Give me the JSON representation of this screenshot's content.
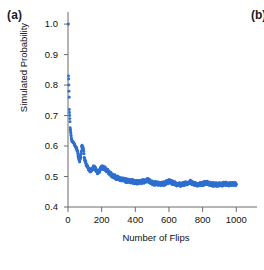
{
  "figure": {
    "panel_label": "(a)",
    "next_panel_label": "(b)",
    "background_color": "#ffffff",
    "series_color": "#2f6fd0",
    "axis_color": "#6b6b6b",
    "text_color": "#111111"
  },
  "chart_data": {
    "type": "scatter",
    "title": "",
    "subtitle": "",
    "xlabel": "Number of Flips",
    "ylabel": "Simulated Probability",
    "xlim": [
      0,
      1040
    ],
    "ylim": [
      0.4,
      1.02
    ],
    "xticks": [
      0,
      200,
      400,
      600,
      800,
      1000
    ],
    "xticklabels": [
      "0",
      "200",
      "400",
      "600",
      "800",
      "1000"
    ],
    "yticks": [
      0.4,
      0.5,
      0.6,
      0.7,
      0.8,
      0.9,
      1.0
    ],
    "yticklabels": [
      "0.4",
      "0.5",
      "0.6",
      "0.7",
      "0.8",
      "0.9",
      "1.0"
    ],
    "grid": false,
    "legend": false,
    "legend_position": "none",
    "marker": "point",
    "marker_size": 2,
    "annotations": [],
    "series": [
      {
        "name": "Simulated Probability",
        "color": "#2f6fd0",
        "x": [
          1,
          2,
          3,
          4,
          5,
          6,
          7,
          8,
          9,
          10,
          11,
          12,
          13,
          14,
          15,
          16,
          17,
          18,
          19,
          20,
          22,
          24,
          26,
          28,
          30,
          32,
          34,
          36,
          38,
          40,
          42,
          44,
          46,
          48,
          50,
          54,
          58,
          62,
          66,
          70,
          74,
          78,
          82,
          86,
          90,
          94,
          98,
          105,
          112,
          120,
          128,
          136,
          144,
          152,
          160,
          170,
          180,
          190,
          200,
          215,
          230,
          245,
          260,
          275,
          290,
          305,
          320,
          335,
          350,
          370,
          390,
          410,
          430,
          450,
          470,
          490,
          510,
          530,
          550,
          575,
          600,
          625,
          650,
          675,
          700,
          725,
          750,
          775,
          800,
          825,
          850,
          875,
          900,
          925,
          950,
          975,
          1000
        ],
        "y": [
          1.0,
          1.0,
          0.83,
          0.82,
          0.8,
          0.78,
          0.76,
          0.72,
          0.71,
          0.7,
          0.69,
          0.68,
          0.66,
          0.655,
          0.65,
          0.645,
          0.64,
          0.635,
          0.63,
          0.625,
          0.62,
          0.617,
          0.615,
          0.613,
          0.612,
          0.611,
          0.61,
          0.608,
          0.605,
          0.603,
          0.6,
          0.598,
          0.596,
          0.594,
          0.592,
          0.585,
          0.575,
          0.565,
          0.558,
          0.552,
          0.56,
          0.575,
          0.6,
          0.598,
          0.59,
          0.575,
          0.56,
          0.545,
          0.535,
          0.528,
          0.522,
          0.518,
          0.525,
          0.532,
          0.528,
          0.518,
          0.512,
          0.52,
          0.53,
          0.528,
          0.52,
          0.512,
          0.505,
          0.5,
          0.496,
          0.493,
          0.49,
          0.488,
          0.487,
          0.485,
          0.483,
          0.481,
          0.48,
          0.484,
          0.488,
          0.483,
          0.478,
          0.476,
          0.475,
          0.478,
          0.484,
          0.479,
          0.475,
          0.473,
          0.478,
          0.482,
          0.477,
          0.474,
          0.476,
          0.479,
          0.475,
          0.473,
          0.474,
          0.476,
          0.475,
          0.474,
          0.475
        ]
      }
    ]
  }
}
